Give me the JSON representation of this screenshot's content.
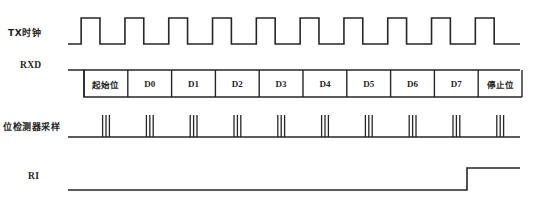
{
  "figure": {
    "type": "timing-diagram",
    "background_color": "#ffffff",
    "line_color": "#262626"
  },
  "signals": [
    {
      "id": "tx_clock",
      "label": "TX时钟",
      "script": "cjk",
      "kind": "clock",
      "baseline_y": 44,
      "high_y": 18,
      "start_x": 68,
      "end_x": 520,
      "period_px": 43.8,
      "duty": 0.5,
      "pulse_count": 10
    },
    {
      "id": "rxd",
      "label": "RXD",
      "script": "latin",
      "kind": "data-frame",
      "idle_y": 70,
      "low_y": 97,
      "start_x": 68,
      "frame_start_x": 84,
      "end_x": 520,
      "cell_width": 43.8,
      "cells": [
        {
          "label": "起始位",
          "script": "cjk"
        },
        {
          "label": "D0",
          "script": "latin"
        },
        {
          "label": "D1",
          "script": "latin"
        },
        {
          "label": "D2",
          "script": "latin"
        },
        {
          "label": "D3",
          "script": "latin"
        },
        {
          "label": "D4",
          "script": "latin"
        },
        {
          "label": "D5",
          "script": "latin"
        },
        {
          "label": "D6",
          "script": "latin"
        },
        {
          "label": "D7",
          "script": "latin"
        },
        {
          "label": "停止位",
          "script": "cjk"
        }
      ]
    },
    {
      "id": "bit_detector_sampling",
      "label": "位检测器采样",
      "script": "cjk",
      "kind": "sample-strobes",
      "baseline_y": 137,
      "tick_top_y": 115,
      "start_x": 68,
      "end_x": 520,
      "group_count": 10,
      "ticks_per_group": 3,
      "tick_spacing_px": 3.4,
      "first_group_center_x": 106,
      "group_pitch_px": 43.8
    },
    {
      "id": "ri",
      "label": "RI",
      "script": "latin",
      "kind": "step",
      "low_y": 190,
      "high_y": 168,
      "start_x": 68,
      "rise_x": 467,
      "end_x": 520
    }
  ]
}
